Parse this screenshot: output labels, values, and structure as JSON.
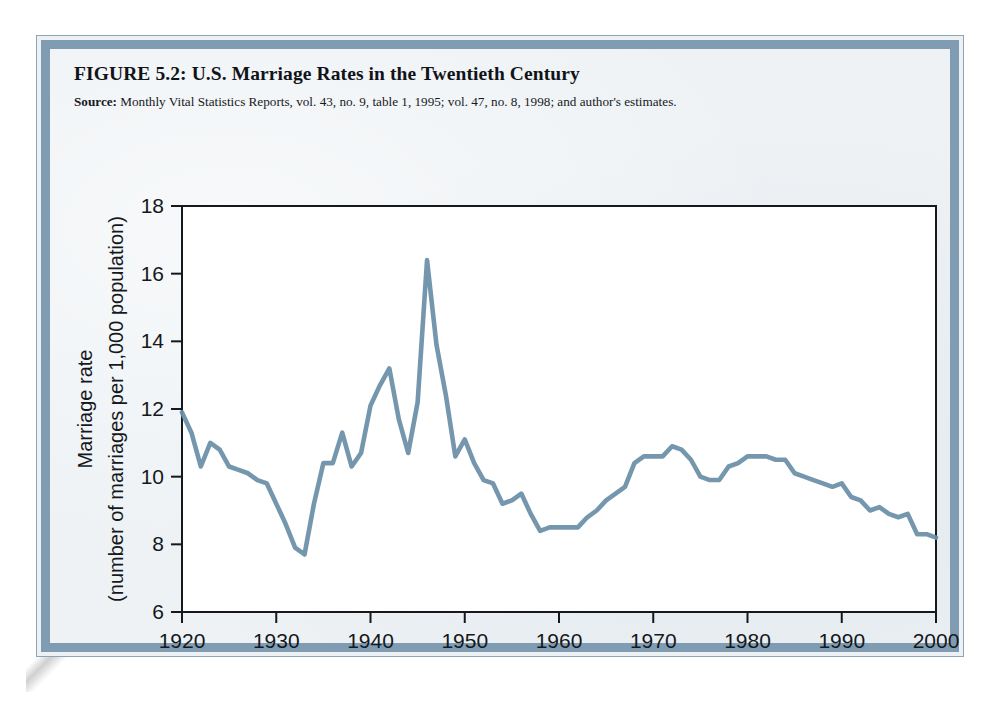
{
  "figure": {
    "title": "FIGURE 5.2:  U.S. Marriage Rates in the Twentieth Century",
    "source_label": "Source:",
    "source_text": " Monthly Vital Statistics Reports, vol. 43, no. 9, table 1, 1995; vol. 47, no. 8, 1998; and author's estimates."
  },
  "colors": {
    "line": "#6b8fa8",
    "axis": "#15181c",
    "border_band": "#7f9cb2",
    "border_rule": "#8ba6b8",
    "plot_background": "#ffffff",
    "plate_background": "#eef2f5"
  },
  "chart_data": {
    "type": "line",
    "title": "FIGURE 5.2:  U.S. Marriage Rates in the Twentieth Century",
    "xlabel": "Year",
    "ylabel": "Marriage rate (number of marriages per 1,000 population)",
    "ylabel_line1": "Marriage rate",
    "ylabel_line2": "(number of marriages per 1,000 population)",
    "xlim": [
      1920,
      2000
    ],
    "ylim": [
      6,
      18
    ],
    "xticks": [
      1920,
      1930,
      1940,
      1950,
      1960,
      1970,
      1980,
      1990,
      2000
    ],
    "xtick_labels": [
      "1920",
      "1930",
      "1940",
      "1950",
      "1960",
      "1970",
      "1980",
      "1990",
      "2000"
    ],
    "yticks": [
      6,
      8,
      10,
      12,
      14,
      16,
      18
    ],
    "ytick_labels": [
      "6",
      "8",
      "10",
      "12",
      "14",
      "16",
      "18"
    ],
    "grid": false,
    "legend": false,
    "series": [
      {
        "name": "Marriage rate",
        "x": [
          1920,
          1921,
          1922,
          1923,
          1924,
          1925,
          1926,
          1927,
          1928,
          1929,
          1930,
          1931,
          1932,
          1933,
          1934,
          1935,
          1936,
          1937,
          1938,
          1939,
          1940,
          1941,
          1942,
          1943,
          1944,
          1945,
          1946,
          1947,
          1948,
          1949,
          1950,
          1951,
          1952,
          1953,
          1954,
          1955,
          1956,
          1957,
          1958,
          1959,
          1960,
          1961,
          1962,
          1963,
          1964,
          1965,
          1966,
          1967,
          1968,
          1969,
          1970,
          1971,
          1972,
          1973,
          1974,
          1975,
          1976,
          1977,
          1978,
          1979,
          1980,
          1981,
          1982,
          1983,
          1984,
          1985,
          1986,
          1987,
          1988,
          1989,
          1990,
          1991,
          1992,
          1993,
          1994,
          1995,
          1996,
          1997,
          1998,
          1999,
          2000
        ],
        "y": [
          11.9,
          11.3,
          10.3,
          11.0,
          10.8,
          10.3,
          10.2,
          10.1,
          9.9,
          9.8,
          9.2,
          8.6,
          7.9,
          7.7,
          9.2,
          10.4,
          10.4,
          11.3,
          10.3,
          10.7,
          12.1,
          12.7,
          13.2,
          11.7,
          10.7,
          12.2,
          16.4,
          13.9,
          12.4,
          10.6,
          11.1,
          10.4,
          9.9,
          9.8,
          9.2,
          9.3,
          9.5,
          8.9,
          8.4,
          8.5,
          8.5,
          8.5,
          8.5,
          8.8,
          9.0,
          9.3,
          9.5,
          9.7,
          10.4,
          10.6,
          10.6,
          10.6,
          10.9,
          10.8,
          10.5,
          10.0,
          9.9,
          9.9,
          10.3,
          10.4,
          10.6,
          10.6,
          10.6,
          10.5,
          10.5,
          10.1,
          10.0,
          9.9,
          9.8,
          9.7,
          9.8,
          9.4,
          9.3,
          9.0,
          9.1,
          8.9,
          8.8,
          8.9,
          8.3,
          8.3,
          8.2
        ]
      }
    ]
  }
}
